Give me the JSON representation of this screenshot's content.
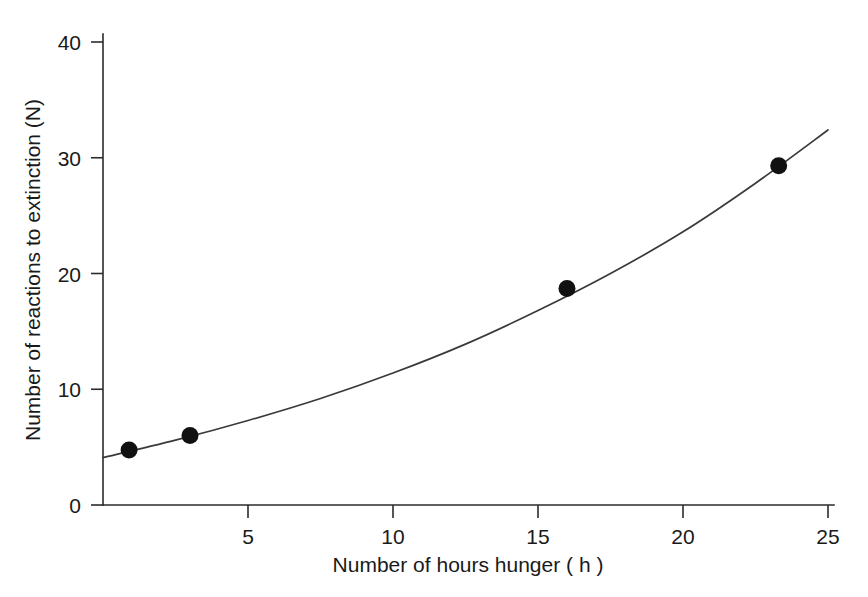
{
  "chart_data": {
    "type": "scatter",
    "title": "",
    "xlabel": "Number of hours hunger ( h )",
    "ylabel": "Number of reactions to extinction (N)",
    "xlim": [
      0,
      25
    ],
    "ylim": [
      0,
      40
    ],
    "xticks": [
      5,
      10,
      15,
      20,
      25
    ],
    "xtick_labels": [
      "5",
      "10",
      "15",
      "20",
      "25"
    ],
    "yticks": [
      0,
      10,
      20,
      30,
      40
    ],
    "ytick_labels": [
      "0",
      "10",
      "20",
      "30",
      "40"
    ],
    "grid": false,
    "legend": "none",
    "series": [
      {
        "name": "Reactions to extinction",
        "marker": "filled-circle",
        "marker_color": "#111111",
        "line_color": "#3a3a3a",
        "x": [
          0.9,
          3.0,
          16.0,
          23.3
        ],
        "values": [
          4.75,
          6.0,
          18.7,
          29.3
        ]
      }
    ],
    "fitted_curve": {
      "name": "fitted trend curve",
      "x": [
        0.0,
        2.5,
        5.0,
        7.5,
        10.0,
        12.5,
        15.0,
        17.5,
        20.0,
        22.5,
        25.0
      ],
      "y": [
        4.1,
        5.6,
        7.3,
        9.2,
        11.4,
        13.9,
        16.8,
        20.0,
        23.6,
        27.8,
        32.4
      ]
    }
  },
  "figure": {
    "background_color": "#ffffff",
    "axis_color": "#2b2b2b",
    "text_color": "#1a1a1a"
  }
}
